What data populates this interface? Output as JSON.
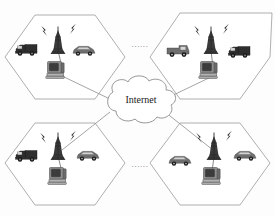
{
  "diagram": {
    "background_color": "#fdfdfd",
    "line_color": "#8d8d8d",
    "hex_stroke_color": "#9a9a9a"
  },
  "cloud": {
    "label": "Internet",
    "name": "internet-cloud"
  },
  "ellipses": [
    {
      "text": "......",
      "position": "top-center"
    },
    {
      "text": "......",
      "position": "bottom-center"
    }
  ],
  "cells": [
    {
      "id": "cell-top-left",
      "label": "",
      "tower": {
        "name": "cell-tower",
        "waves": [
          "left",
          "right"
        ]
      },
      "nodes": [
        {
          "name": "truck-vehicle",
          "type": "truck",
          "shade": "dark"
        },
        {
          "name": "car-vehicle",
          "type": "car",
          "shade": "mid"
        },
        {
          "name": "base-station-computer",
          "type": "computer",
          "shade": "gray"
        }
      ]
    },
    {
      "id": "cell-top-right",
      "label": "",
      "tower": {
        "name": "cell-tower",
        "waves": [
          "left",
          "right"
        ]
      },
      "nodes": [
        {
          "name": "van-vehicle",
          "type": "van",
          "shade": "mid"
        },
        {
          "name": "truck-vehicle",
          "type": "truck",
          "shade": "dark"
        },
        {
          "name": "base-station-computer",
          "type": "computer",
          "shade": "gray"
        }
      ]
    },
    {
      "id": "cell-bottom-left",
      "label": "",
      "tower": {
        "name": "cell-tower",
        "waves": [
          "left",
          "right"
        ]
      },
      "nodes": [
        {
          "name": "truck-vehicle",
          "type": "truck",
          "shade": "dark"
        },
        {
          "name": "car-vehicle",
          "type": "car",
          "shade": "mid"
        },
        {
          "name": "base-station-computer",
          "type": "computer",
          "shade": "gray"
        }
      ]
    },
    {
      "id": "cell-bottom-right",
      "label": "",
      "tower": {
        "name": "cell-tower",
        "waves": [
          "left",
          "right"
        ]
      },
      "nodes": [
        {
          "name": "car-vehicle",
          "type": "car",
          "shade": "mid"
        },
        {
          "name": "car-vehicle",
          "type": "car",
          "shade": "mid"
        },
        {
          "name": "base-station-computer",
          "type": "computer",
          "shade": "gray"
        }
      ]
    }
  ]
}
